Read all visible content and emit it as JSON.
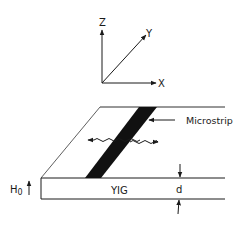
{
  "axes": {
    "z_label": "Z",
    "y_label": "Y",
    "x_label": "X"
  },
  "device": {
    "strip_label": "Microstrip",
    "substrate_label": "YIG",
    "thickness_label": "d",
    "field_label_main": "H",
    "field_label_sub": "0"
  },
  "colors": {
    "line": "#1a1a1a",
    "strip": "#111111",
    "background": "#ffffff"
  }
}
